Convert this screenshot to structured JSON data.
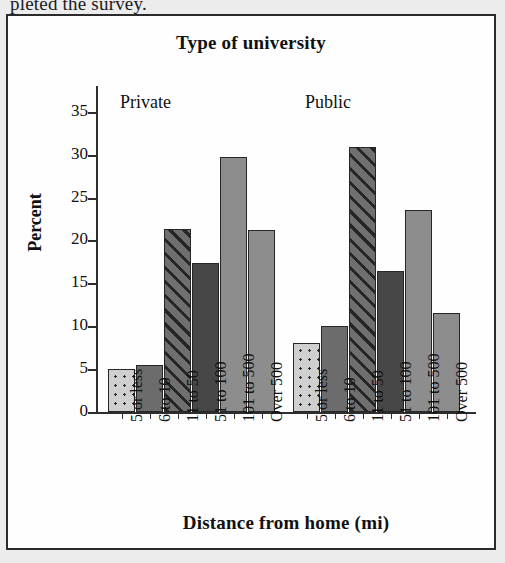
{
  "page": {
    "cutoff_text": "pleted the survey."
  },
  "chart_data": {
    "type": "bar",
    "title": "Type of university",
    "xlabel": "Distance from home (mi)",
    "ylabel": "Percent",
    "ylim": [
      0,
      38
    ],
    "yticks": [
      0,
      5,
      10,
      15,
      20,
      25,
      30,
      35
    ],
    "ytick_labels": [
      "0",
      "5",
      "10",
      "15",
      "20",
      "25",
      "30",
      "35"
    ],
    "grid": false,
    "legend": "none",
    "panels": [
      {
        "label": "Private",
        "categories": [
          "5 or less",
          "6 to 10",
          "11 to 50",
          "51 to 100",
          "101 to 500",
          "Over 500"
        ],
        "values": [
          5.0,
          5.5,
          21.3,
          17.4,
          29.7,
          21.2
        ]
      },
      {
        "label": "Public",
        "categories": [
          "5 or less",
          "6 to 10",
          "11 to 50",
          "51 to 100",
          "101 to 500",
          "Over 500"
        ],
        "values": [
          8.1,
          10.0,
          30.9,
          16.4,
          23.6,
          11.5
        ]
      }
    ],
    "bar_fills": [
      "dots",
      "solid-mid",
      "hatch",
      "solid-dark",
      "solid-light",
      "solid-light"
    ],
    "colors": {
      "dots": "#cfcfcf",
      "solid-mid": "#6c6c6c",
      "hatch": "#6f6f6f",
      "solid-dark": "#474747",
      "solid-light": "#8d8d8d",
      "axis": "#2e2e2e",
      "text": "#111111",
      "panel_background": "#fefefe",
      "page_background": "#ececed"
    }
  }
}
